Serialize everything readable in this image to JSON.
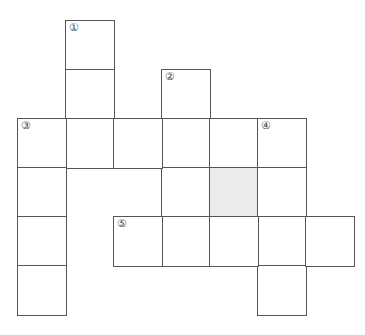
{
  "puzzle": {
    "type": "crossword",
    "cell_size": 48,
    "origin_x": 17,
    "origin_y": 20,
    "row_pitch": 49,
    "colors": {
      "border": "#555555",
      "shaded": "#ebebeb",
      "background": "#ffffff"
    },
    "clue_numbers": [
      "①",
      "②",
      "③",
      "④",
      "⑤"
    ],
    "cells": [
      {
        "row": 0,
        "col": 1,
        "label": "①"
      },
      {
        "row": 1,
        "col": 1
      },
      {
        "row": 2,
        "col": 1
      },
      {
        "row": 1,
        "col": 3,
        "label": "②"
      },
      {
        "row": 2,
        "col": 3
      },
      {
        "row": 3,
        "col": 3
      },
      {
        "row": 4,
        "col": 3
      },
      {
        "row": 2,
        "col": 0,
        "label": "③"
      },
      {
        "row": 2,
        "col": 2
      },
      {
        "row": 2,
        "col": 4
      },
      {
        "row": 2,
        "col": 5,
        "label": "④"
      },
      {
        "row": 3,
        "col": 0
      },
      {
        "row": 4,
        "col": 0
      },
      {
        "row": 5,
        "col": 0
      },
      {
        "row": 3,
        "col": 4,
        "shaded": true
      },
      {
        "row": 3,
        "col": 5
      },
      {
        "row": 4,
        "col": 5
      },
      {
        "row": 5,
        "col": 5
      },
      {
        "row": 4,
        "col": 2,
        "label": "⑤"
      },
      {
        "row": 4,
        "col": 4
      },
      {
        "row": 4,
        "col": 6
      }
    ]
  }
}
